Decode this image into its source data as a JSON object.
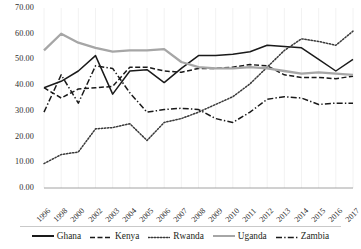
{
  "chart_data": {
    "type": "line",
    "title": "",
    "xlabel": "",
    "ylabel": "",
    "ylim": [
      0,
      70
    ],
    "ytick_step": 10,
    "grid": false,
    "legend_position": "bottom",
    "ytick_labels": [
      "70.00",
      "60.00",
      "50.00",
      "40.00",
      "30.00",
      "20.00",
      "10.00",
      "0.00"
    ],
    "categories": [
      "1996",
      "1998",
      "2000",
      "2002",
      "2003",
      "2004",
      "2005",
      "2006",
      "2007",
      "2008",
      "2009",
      "2010",
      "2011",
      "2012",
      "2013",
      "2014",
      "2015",
      "2016",
      "2017"
    ],
    "series": [
      {
        "name": "Ghana",
        "color": "#1a1a1a",
        "style": "solid",
        "values": [
          39.0,
          41.5,
          45.5,
          51.5,
          36.5,
          45.5,
          46.0,
          41.0,
          46.5,
          51.5,
          51.5,
          52.0,
          53.0,
          55.5,
          55.0,
          54.5,
          50.0,
          45.5,
          50.0
        ]
      },
      {
        "name": "Kenya",
        "color": "#1a1a1a",
        "style": "dashed",
        "values": [
          39.0,
          35.0,
          38.5,
          39.0,
          39.5,
          47.0,
          47.0,
          45.5,
          45.0,
          46.5,
          46.5,
          47.0,
          48.0,
          47.5,
          44.0,
          43.0,
          43.0,
          42.5,
          43.5
        ]
      },
      {
        "name": "Rwanda",
        "color": "#3a3a3a",
        "style": "dotted",
        "values": [
          9.5,
          13.0,
          14.0,
          23.0,
          23.5,
          25.0,
          18.5,
          25.5,
          27.0,
          29.5,
          32.5,
          35.5,
          40.5,
          47.0,
          53.5,
          58.0,
          57.0,
          55.5,
          61.0
        ]
      },
      {
        "name": "Uganda",
        "color": "#a6a6a6",
        "style": "solid",
        "values": [
          53.5,
          60.0,
          56.5,
          54.5,
          53.0,
          53.5,
          53.5,
          54.0,
          49.0,
          47.0,
          46.5,
          46.5,
          47.0,
          46.5,
          45.5,
          44.5,
          45.0,
          44.5,
          44.0
        ]
      },
      {
        "name": "Zambia",
        "color": "#1a1a1a",
        "style": "dashdot",
        "values": [
          29.5,
          44.0,
          33.0,
          47.5,
          46.5,
          37.0,
          29.5,
          30.5,
          31.0,
          30.5,
          27.0,
          25.5,
          29.5,
          34.5,
          35.5,
          35.0,
          32.5,
          33.0,
          33.0
        ]
      }
    ]
  },
  "legend": {
    "items": [
      {
        "label": "Ghana"
      },
      {
        "label": "Kenya"
      },
      {
        "label": "Rwanda"
      },
      {
        "label": "Uganda"
      },
      {
        "label": "Zambia"
      }
    ]
  }
}
